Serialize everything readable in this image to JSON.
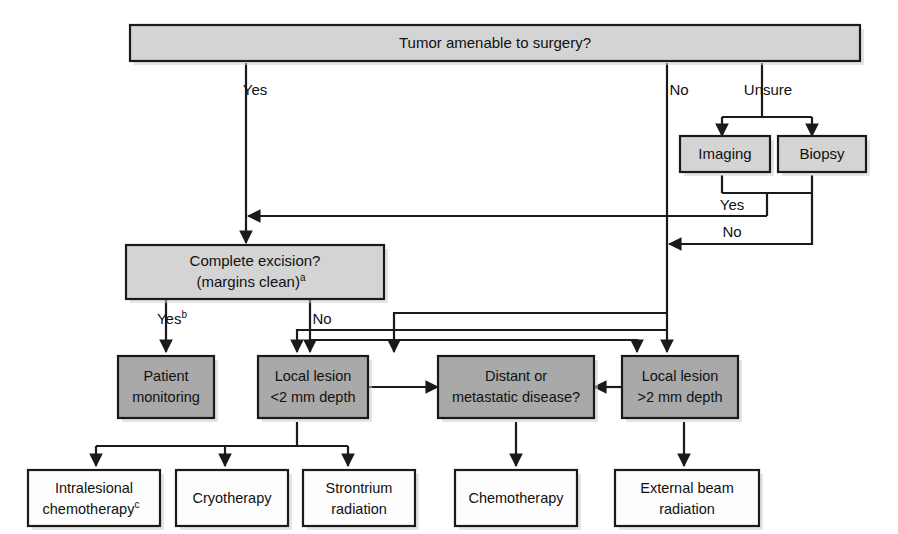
{
  "diagram": {
    "colors": {
      "light_gray": "#d4d4d4",
      "mid_gray": "#a9a9a9",
      "white": "#fdfdfd",
      "line": "#1a1a1a"
    },
    "nodes": {
      "root": {
        "label": "Tumor amenable to surgery?",
        "shade": "light"
      },
      "imaging": {
        "label": "Imaging",
        "shade": "light"
      },
      "biopsy": {
        "label": "Biopsy",
        "shade": "light"
      },
      "excision": {
        "line1": "Complete excision?",
        "line2": "(margins clean)",
        "sup": "a",
        "shade": "light"
      },
      "patient_monitoring": {
        "line1": "Patient",
        "line2": "monitoring",
        "shade": "mid"
      },
      "local_lesion_small": {
        "line1": "Local lesion",
        "line2": "<2 mm depth",
        "shade": "mid"
      },
      "distant": {
        "line1": "Distant or",
        "line2": "metastatic disease?",
        "shade": "mid"
      },
      "local_lesion_large": {
        "line1": "Local lesion",
        "line2": ">2 mm depth",
        "shade": "mid"
      },
      "intralesional": {
        "line1": "Intralesional",
        "line2": "chemotherapy",
        "sup": "c",
        "shade": "white"
      },
      "cryotherapy": {
        "label": "Cryotherapy",
        "shade": "white"
      },
      "strontrium": {
        "line1": "Strontrium",
        "line2": "radiation",
        "shade": "white"
      },
      "chemotherapy": {
        "label": "Chemotherapy",
        "shade": "white"
      },
      "external_beam": {
        "line1": "External beam",
        "line2": "radiation",
        "shade": "white"
      }
    },
    "edge_labels": {
      "root_yes": "Yes",
      "root_no": "No",
      "root_unsure": "Unsure",
      "workup_yes": "Yes",
      "workup_no": "No",
      "excision_yes": "Yes",
      "excision_yes_sup": "b",
      "excision_no": "No"
    }
  }
}
